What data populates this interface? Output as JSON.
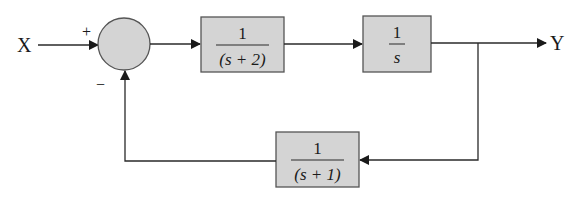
{
  "diagram": {
    "type": "block-diagram",
    "input": {
      "label": "X"
    },
    "output": {
      "label": "Y"
    },
    "summing_junction": {
      "plus_sign": "+",
      "minus_sign": "−"
    },
    "blocks": [
      {
        "id": "G1",
        "numerator": "1",
        "denominator": "(s + 2)"
      },
      {
        "id": "G2",
        "numerator": "1",
        "denominator": "s"
      },
      {
        "id": "H",
        "numerator": "1",
        "denominator": "(s + 1)"
      }
    ],
    "colors": {
      "block_fill": "#d4d4d4",
      "junction_fill": "#d4d4d4",
      "stroke": "#2a2a2a"
    }
  }
}
